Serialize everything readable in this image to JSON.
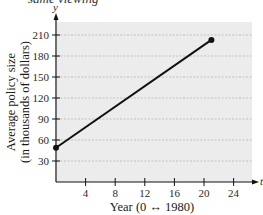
{
  "cropped_caption": "same viewing",
  "chart_data": {
    "type": "line",
    "title": "",
    "xlabel": "Year (0 ↔ 1980)",
    "ylabel": "Average policy size",
    "ylabel_line2": "(in thousands of dollars)",
    "x_axis_var": "t",
    "y_axis_var": "y",
    "x": [
      0,
      21
    ],
    "series": [
      {
        "name": "Average policy size",
        "values": [
          49,
          203
        ],
        "color": "#111111",
        "markers": true
      }
    ],
    "xlim": [
      0,
      25.5
    ],
    "ylim": [
      0,
      228
    ],
    "xticks": [
      4,
      8,
      12,
      16,
      20,
      24
    ],
    "xtick_labels": [
      "4",
      "8",
      "12",
      "16",
      "20",
      "24"
    ],
    "yticks": [
      30,
      60,
      90,
      120,
      150,
      180,
      210
    ],
    "ytick_labels": [
      "30",
      "60",
      "90",
      "120",
      "150",
      "180",
      "210"
    ],
    "grid": "horizontal dashed",
    "plot_background": "#ececec",
    "legend": null
  }
}
